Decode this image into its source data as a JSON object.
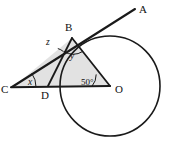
{
  "figure": {
    "type": "circle-tangent-geometry-diagram",
    "background_color": "#ffffff",
    "stroke_color": "#1a1a1a",
    "shaded_region_color": "#e2e2e2"
  },
  "points": {
    "A": {
      "label": "A",
      "x": 135,
      "y": 9,
      "label_x": 139,
      "label_y": 12
    },
    "B": {
      "label": "B",
      "x": 72,
      "y": 38,
      "label_x": 66,
      "label_y": 30
    },
    "C": {
      "label": "C",
      "x": 13,
      "y": 87,
      "label_x": 2,
      "label_y": 92
    },
    "D": {
      "label": "D",
      "x": 48,
      "y": 86,
      "label_x": 42,
      "label_y": 98
    },
    "O": {
      "label": "O",
      "x": 110,
      "y": 86,
      "label_x": 115,
      "label_y": 92
    }
  },
  "circle": {
    "center_x": 110,
    "center_y": 86,
    "radius": 50
  },
  "angles": [
    {
      "name": "angle-at-C",
      "label": "x",
      "vertex": "C",
      "label_x": 29,
      "label_y": 84,
      "italic": true
    },
    {
      "name": "angle-at-B-outer",
      "label": "z",
      "vertex": "B",
      "label_x": 47,
      "label_y": 44,
      "italic": true
    },
    {
      "name": "angle-at-B-inner",
      "label": "y",
      "vertex": "B",
      "label_x": 70,
      "label_y": 58,
      "italic": true
    },
    {
      "name": "angle-at-O",
      "label": "50°",
      "vertex": "O",
      "label_x": 82,
      "label_y": 84,
      "italic": false
    }
  ],
  "segments": [
    {
      "name": "ray-C-to-A",
      "from": "C",
      "to": "A"
    },
    {
      "name": "segment-C-to-O",
      "from": "C",
      "to": "O"
    },
    {
      "name": "segment-B-to-O",
      "from": "B",
      "to": "O"
    },
    {
      "name": "segment-B-to-D",
      "from": "B",
      "to": "D"
    }
  ],
  "shaded_triangle": {
    "name": "triangle-C-B-O",
    "vertices": [
      "C",
      "B",
      "O"
    ]
  }
}
